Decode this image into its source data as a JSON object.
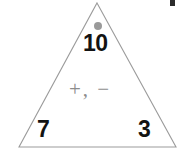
{
  "figure": {
    "type": "number-bond-triangle",
    "sum": "10",
    "addend_left": "7",
    "addend_right": "3",
    "operators": "+, −",
    "marks": {
      "apex_dot": "gray-dot",
      "corner_artifact": "page-edge-mark"
    },
    "colors": {
      "outline": "#9b9b9b",
      "number": "#131313",
      "operator": "#8c8c8c",
      "dot": "#9a9a9a",
      "background": "#ffffff"
    },
    "geometry": {
      "apex": "97,3",
      "bottom_left": "19,147",
      "bottom_right": "176,147"
    }
  }
}
